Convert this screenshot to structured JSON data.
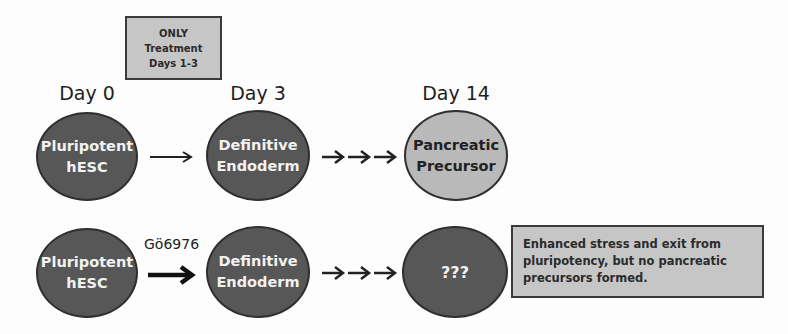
{
  "treatment_note": {
    "lines": [
      "ONLY",
      "Treatment",
      "Days 1-3"
    ]
  },
  "day_labels": [
    "Day 0",
    "Day 3",
    "Day 14"
  ],
  "control_row": {
    "stages": [
      {
        "lines": [
          "Pluripotent",
          "hESC"
        ],
        "shade": "dark"
      },
      {
        "lines": [
          "Definitive",
          "Endoderm"
        ],
        "shade": "dark"
      },
      {
        "lines": [
          "Pancreatic",
          "Precursor"
        ],
        "shade": "light"
      }
    ],
    "arrows": [
      "single-arrow",
      "triple-arrow"
    ]
  },
  "treated_row": {
    "treatment_label": "Gö6976",
    "stages": [
      {
        "lines": [
          "Pluripotent",
          "hESC"
        ],
        "shade": "dark"
      },
      {
        "lines": [
          "Definitive",
          "Endoderm"
        ],
        "shade": "dark"
      },
      {
        "lines": [
          "???"
        ],
        "shade": "dark"
      }
    ],
    "arrows": [
      "bold-arrow",
      "triple-arrow"
    ]
  },
  "outcome_note": {
    "lines": [
      "Enhanced stress and exit from",
      "pluripotency, but no pancreatic",
      "precursors formed."
    ]
  },
  "colors": {
    "dark_cell": "#575757",
    "light_cell": "#b9b9b9",
    "note_fill": "#c6c6c6",
    "outline": "#2f2f2f"
  }
}
